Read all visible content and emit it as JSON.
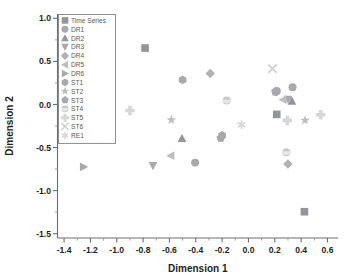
{
  "chart_data": {
    "type": "scatter",
    "title": "",
    "xlabel": "Dimension 1",
    "ylabel": "Dimension 2",
    "xlim": [
      -1.45,
      0.68
    ],
    "ylim": [
      -1.55,
      1.05
    ],
    "xticks": [
      -1.4,
      -1.2,
      -1.0,
      -0.8,
      -0.6,
      -0.4,
      -0.2,
      0.0,
      0.2,
      0.4,
      0.6
    ],
    "xtick_labels": [
      "-1.4",
      "-1.2",
      "-1.0",
      "-0.8",
      "-0.6",
      "-0.4",
      "-0.2",
      "0.0",
      "0.2",
      "0.4",
      "0.6"
    ],
    "yticks": [
      1.0,
      0.5,
      0.0,
      -0.5,
      -1.0,
      -1.5
    ],
    "ytick_labels": [
      "1.0",
      "0.5",
      "0.0",
      "-0.5",
      "-1.0",
      "-1.5"
    ],
    "x_minor_step": 0.1,
    "y_minor_step": 0.25,
    "grid": false,
    "legend_position": "top-left",
    "marker_color": "#a7a9ac",
    "series": [
      {
        "name": "Time Series",
        "marker": "square",
        "color": "#939598",
        "points": [
          {
            "x": -0.785,
            "y": 0.655
          },
          {
            "x": 0.215,
            "y": -0.115
          },
          {
            "x": 0.425,
            "y": -1.245
          }
        ]
      },
      {
        "name": "DR1",
        "marker": "circle",
        "color": "#a7a9ac",
        "points": [
          {
            "x": -0.405,
            "y": -0.675
          },
          {
            "x": 0.215,
            "y": 0.155
          },
          {
            "x": 0.335,
            "y": 0.2
          }
        ]
      },
      {
        "name": "DR2",
        "marker": "triangle-up",
        "color": "#939598",
        "points": [
          {
            "x": -0.505,
            "y": -0.395
          },
          {
            "x": 0.33,
            "y": 0.04
          }
        ]
      },
      {
        "name": "DR3",
        "marker": "triangle-down",
        "color": "#a7a9ac",
        "points": [
          {
            "x": -0.725,
            "y": -0.71
          },
          {
            "x": 0.3,
            "y": 0.06
          }
        ]
      },
      {
        "name": "DR4",
        "marker": "diamond",
        "color": "#b0b2b4",
        "points": [
          {
            "x": -0.29,
            "y": 0.36
          },
          {
            "x": 0.3,
            "y": -0.69
          }
        ]
      },
      {
        "name": "DR5",
        "marker": "triangle-left",
        "color": "#bcbec0",
        "points": [
          {
            "x": -0.59,
            "y": -0.595
          },
          {
            "x": 0.262,
            "y": 0.055
          }
        ]
      },
      {
        "name": "DR6",
        "marker": "triangle-right",
        "color": "#a7a9ac",
        "points": [
          {
            "x": -1.252,
            "y": -0.725
          }
        ]
      },
      {
        "name": "ST1",
        "marker": "hexagon",
        "color": "#a7a9ac",
        "points": [
          {
            "x": -0.5,
            "y": 0.285
          },
          {
            "x": -0.2,
            "y": -0.36
          },
          {
            "x": 0.207,
            "y": 0.145
          }
        ]
      },
      {
        "name": "ST2",
        "marker": "star",
        "color": "#bcbec0",
        "points": [
          {
            "x": -0.585,
            "y": -0.18
          },
          {
            "x": 0.43,
            "y": -0.185
          }
        ]
      },
      {
        "name": "ST3",
        "marker": "pentagon",
        "color": "#a7a9ac",
        "points": [
          {
            "x": -0.21,
            "y": -0.39
          },
          {
            "x": 0.205,
            "y": 0.148
          }
        ]
      },
      {
        "name": "ST4",
        "marker": "circle-open",
        "color": "#c7c9cb",
        "points": [
          {
            "x": -0.165,
            "y": 0.045
          },
          {
            "x": 0.288,
            "y": -0.555
          }
        ]
      },
      {
        "name": "ST5",
        "marker": "plus",
        "color": "#d6d7d9",
        "points": [
          {
            "x": -0.9,
            "y": -0.07
          },
          {
            "x": 0.295,
            "y": -0.185
          },
          {
            "x": 0.548,
            "y": -0.12
          }
        ]
      },
      {
        "name": "ST6",
        "marker": "x",
        "color": "#d1d3d4",
        "points": [
          {
            "x": 0.182,
            "y": 0.415
          }
        ]
      },
      {
        "name": "RE1",
        "marker": "asterisk",
        "color": "#d6d7d9",
        "points": [
          {
            "x": -0.052,
            "y": -0.235
          }
        ]
      }
    ]
  },
  "legend": {
    "entries": [
      {
        "label": "Time Series"
      },
      {
        "label": "DR1"
      },
      {
        "label": "DR2"
      },
      {
        "label": "DR3"
      },
      {
        "label": "DR4"
      },
      {
        "label": "DR5"
      },
      {
        "label": "DR6"
      },
      {
        "label": "ST1"
      },
      {
        "label": "ST2"
      },
      {
        "label": "ST3"
      },
      {
        "label": "ST4"
      },
      {
        "label": "ST5"
      },
      {
        "label": "ST6"
      },
      {
        "label": "RE1"
      }
    ]
  }
}
